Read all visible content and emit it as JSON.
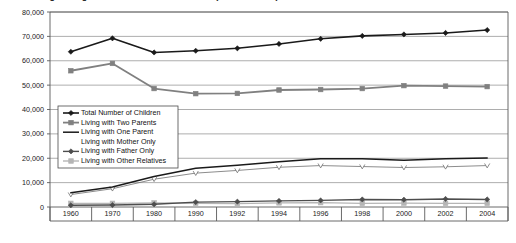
{
  "chart_data": {
    "type": "line",
    "title": "Living Arrangements of Children Under 18 (in thousands)",
    "xlabel": "",
    "ylabel": "",
    "grid": true,
    "legend_position": "inside-left",
    "ylim": [
      0,
      80000
    ],
    "yticks": [
      0,
      10000,
      20000,
      30000,
      40000,
      50000,
      60000,
      70000,
      80000
    ],
    "ytick_labels": [
      "0",
      "10,000",
      "20,000",
      "30,000",
      "40,000",
      "50,000",
      "60,000",
      "70,000",
      "80,000"
    ],
    "categories": [
      "1960",
      "1970",
      "1980",
      "1990",
      "1992",
      "1994",
      "1996",
      "1998",
      "2000",
      "2002",
      "2004"
    ],
    "series": [
      {
        "name": "Total Number of Children",
        "color": "#1a1a1a",
        "marker": "diamond",
        "width": 1.6,
        "values": [
          63700,
          69200,
          63400,
          64100,
          65100,
          66900,
          69000,
          70200,
          70800,
          71400,
          72600
        ]
      },
      {
        "name": "Living with Two Parents",
        "color": "#808080",
        "marker": "square",
        "width": 1.8,
        "values": [
          55900,
          58900,
          48600,
          46500,
          46600,
          48000,
          48200,
          48600,
          49800,
          49600,
          49400
        ]
      },
      {
        "name": "Living with One Parent",
        "color": "#1a1a1a",
        "marker": "none",
        "width": 1.5,
        "values": [
          5800,
          8200,
          12500,
          15900,
          17100,
          18600,
          19800,
          19800,
          19200,
          19800,
          20100
        ]
      },
      {
        "name": "Living with Mother Only",
        "color": "#6e6e6e",
        "marker": "open-v",
        "width": 0.8,
        "values": [
          5100,
          7500,
          11400,
          13900,
          15000,
          16300,
          17000,
          16600,
          16200,
          16500,
          17000
        ]
      },
      {
        "name": "Living with Father Only",
        "color": "#4d4d4d",
        "marker": "diamond",
        "width": 1.4,
        "values": [
          700,
          800,
          1100,
          2000,
          2200,
          2500,
          2700,
          3100,
          3000,
          3300,
          3100
        ]
      },
      {
        "name": "Living with Other Relatives",
        "color": "#b5b5b5",
        "marker": "square",
        "width": 1.2,
        "values": [
          1500,
          1500,
          1700,
          1500,
          1400,
          1700,
          1800,
          1500,
          1600,
          1500,
          1500
        ]
      }
    ]
  }
}
